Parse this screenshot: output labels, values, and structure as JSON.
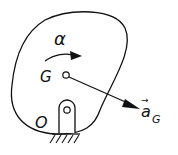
{
  "diagram": {
    "type": "rigid-body-kinematics",
    "labels": {
      "angular_acceleration": "α",
      "center_of_mass": "G",
      "pivot": "O",
      "acceleration_vector": "a",
      "acceleration_subscript": "G",
      "vector_arrow": "→"
    },
    "colors": {
      "stroke": "#111111",
      "background": "#ffffff"
    }
  }
}
